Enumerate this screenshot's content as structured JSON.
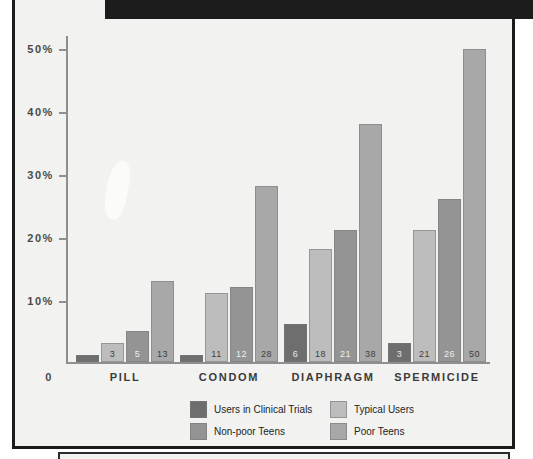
{
  "chart_data": {
    "type": "bar",
    "title": "",
    "xlabel": "",
    "ylabel": "",
    "ylim": [
      0,
      52
    ],
    "grid": false,
    "legend_position": "bottom",
    "categories": [
      "Pill",
      "Condom",
      "Diaphragm",
      "Spermicide"
    ],
    "ytick_labels": [
      "50%",
      "40%",
      "30%",
      "20%",
      "10%",
      "0"
    ],
    "ytick_values": [
      50,
      40,
      30,
      20,
      10,
      0
    ],
    "series": [
      {
        "name": "Users in Clinical Trials",
        "color": "#6e6e6e",
        "values": [
          0.5,
          1.0,
          6,
          3
        ],
        "labels": [
          "",
          "",
          "6",
          "3"
        ]
      },
      {
        "name": "Typical Users",
        "color": "#bdbdbd",
        "values": [
          3,
          11,
          18,
          21
        ],
        "labels": [
          "3",
          "11",
          "18",
          "21"
        ]
      },
      {
        "name": "Non-poor Teens",
        "color": "#949494",
        "values": [
          5,
          12,
          21,
          26
        ],
        "labels": [
          "5",
          "12",
          "21",
          "26"
        ]
      },
      {
        "name": "Poor Teens",
        "color": "#a8a8a8",
        "values": [
          13,
          28,
          38,
          50
        ],
        "labels": [
          "13",
          "28",
          "38",
          "50"
        ]
      }
    ]
  },
  "axis": {
    "ticks": [
      {
        "label": "50%",
        "value": 50
      },
      {
        "label": "40%",
        "value": 40
      },
      {
        "label": "30%",
        "value": 30
      },
      {
        "label": "20%",
        "value": 20
      },
      {
        "label": "10%",
        "value": 10
      },
      {
        "label": "0",
        "value": 0
      }
    ]
  },
  "legend": {
    "entries": [
      {
        "label": "Users in Clinical Trials",
        "color": "#6e6e6e"
      },
      {
        "label": "Typical Users",
        "color": "#bdbdbd"
      },
      {
        "label": "Non-poor Teens",
        "color": "#949494"
      },
      {
        "label": "Poor Teens",
        "color": "#a8a8a8"
      }
    ]
  }
}
